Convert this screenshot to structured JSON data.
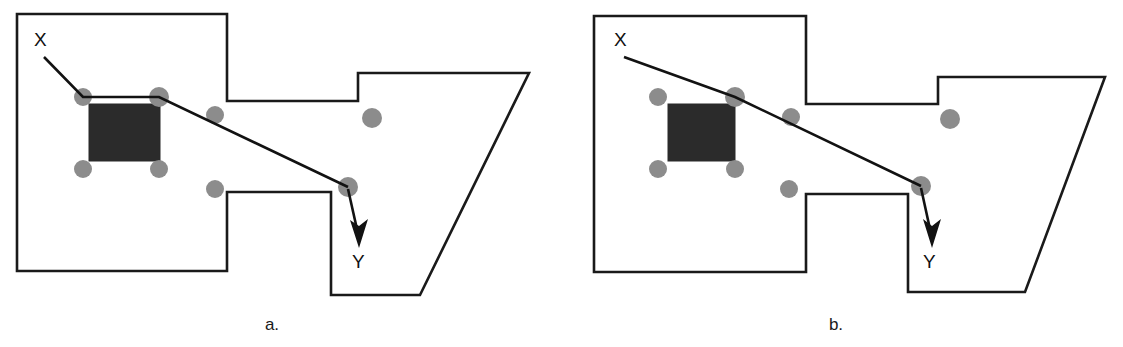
{
  "figure": {
    "background_color": "#ffffff",
    "width": 1123,
    "height": 347
  },
  "style": {
    "outline_stroke": "#1a1a1a",
    "dot_fill": "#8c8c8c",
    "obstacle_fill": "#2b2b2b",
    "path_stroke": "#121212",
    "label_color": "#111111"
  },
  "panels": [
    {
      "id": "a",
      "caption": "a.",
      "caption_pos": {
        "x": 272,
        "y": 330
      },
      "start_label": {
        "text": "X",
        "x": 34,
        "y": 46
      },
      "end_label": {
        "text": "Y",
        "x": 352,
        "y": 268
      },
      "room_polygon": "17,14 227,14 227,101 358,101 358,73 529,73 420,295 331,295 331,192 227,192 227,271 17,271",
      "obstacle": {
        "x": 89,
        "y": 104,
        "width": 71,
        "height": 57
      },
      "waypoints": [
        {
          "name": "dot-square-top-left",
          "x": 83,
          "y": 97,
          "r": 9
        },
        {
          "name": "dot-square-top-right",
          "x": 159,
          "y": 97,
          "r": 10
        },
        {
          "name": "dot-square-bottom-left",
          "x": 83,
          "y": 169,
          "r": 9
        },
        {
          "name": "dot-square-bottom-right",
          "x": 159,
          "y": 169,
          "r": 9
        },
        {
          "name": "dot-corridor-upper",
          "x": 215,
          "y": 115,
          "r": 9
        },
        {
          "name": "dot-corridor-lower",
          "x": 215,
          "y": 189,
          "r": 9
        },
        {
          "name": "dot-right-room",
          "x": 372,
          "y": 118,
          "r": 10
        },
        {
          "name": "dot-junction",
          "x": 348,
          "y": 187,
          "r": 10
        }
      ],
      "path_points": "44,57 83,97 159,97 348,187",
      "arrow": {
        "tail": {
          "x": 348,
          "y": 189
        },
        "tip": {
          "x": 359,
          "y": 243
        },
        "head_polygon": "359,248 350,220 359,226 368,219"
      }
    },
    {
      "id": "b",
      "caption": "b.",
      "caption_pos": {
        "x": 836,
        "y": 330
      },
      "start_label": {
        "text": "X",
        "x": 614,
        "y": 46
      },
      "end_label": {
        "text": "Y",
        "x": 923,
        "y": 268
      },
      "room_polygon": "594,16 806,16 806,104 938,104 938,77 1105,77 1025,292 908,292 908,194 806,194 806,272 594,272",
      "obstacle": {
        "x": 668,
        "y": 104,
        "width": 67,
        "height": 57
      },
      "waypoints": [
        {
          "name": "dot-square-top-left",
          "x": 658,
          "y": 97,
          "r": 9
        },
        {
          "name": "dot-square-top-right",
          "x": 735,
          "y": 97,
          "r": 10
        },
        {
          "name": "dot-square-bottom-left",
          "x": 658,
          "y": 169,
          "r": 9
        },
        {
          "name": "dot-square-bottom-right",
          "x": 735,
          "y": 169,
          "r": 9
        },
        {
          "name": "dot-corridor-upper",
          "x": 791,
          "y": 117,
          "r": 9
        },
        {
          "name": "dot-corridor-lower",
          "x": 789,
          "y": 189,
          "r": 9
        },
        {
          "name": "dot-right-room",
          "x": 950,
          "y": 119,
          "r": 10
        },
        {
          "name": "dot-junction",
          "x": 921,
          "y": 186,
          "r": 10
        }
      ],
      "path_points": "624,57 735,97 921,186",
      "arrow": {
        "tail": {
          "x": 921,
          "y": 188
        },
        "tip": {
          "x": 932,
          "y": 243
        },
        "head_polygon": "932,248 923,219 932,226 941,219"
      }
    }
  ]
}
